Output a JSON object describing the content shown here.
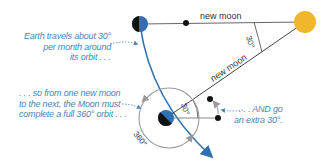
{
  "labels": {
    "new_moon_top": "new moon",
    "new_moon_diag": "new moon",
    "angle_sun": "30°",
    "angle_earth": "30°",
    "full_orbit": "360°"
  },
  "captions": {
    "earth_travels": [
      "Earth travels about 30°",
      "per month around",
      "its orbit . . ."
    ],
    "so_from": [
      ". . . so from one new moon",
      "to the next, the Moon must",
      "complete a full 360° orbit . . ."
    ],
    "and_go": [
      ". . . AND go",
      "an extra 30°."
    ]
  },
  "colors": {
    "sun": "#f0b72c",
    "earth_blue": "#2f6fb3",
    "earth_dark": "#111111",
    "orbit_path": "#2f6fb3",
    "line": "#555555",
    "caption": "#4a86b8",
    "circle": "#9a9a9a"
  }
}
